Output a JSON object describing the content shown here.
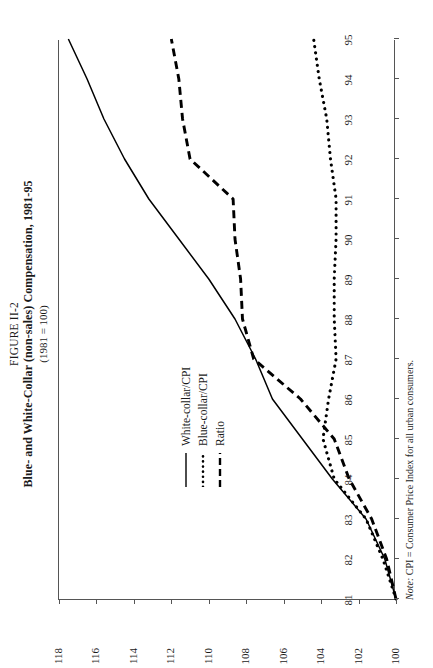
{
  "figure": {
    "number": "FIGURE II-2",
    "title": "Blue- and White-Collar (non-sales) Compensation, 1981-95",
    "subtitle": "(1981 = 100)",
    "note_label": "Note:",
    "note_text": "CPI = Consumer Price Index for all urban consumers."
  },
  "legend": {
    "position": "upper-left-inside",
    "items": [
      {
        "label": "White-collar/CPI",
        "style": "solid"
      },
      {
        "label": "Blue-collar/CPI",
        "style": "dotted"
      },
      {
        "label": "Ratio",
        "style": "dashed"
      }
    ]
  },
  "chart_data": {
    "type": "line",
    "title": "Blue- and White-Collar (non-sales) Compensation, 1981-95",
    "subtitle": "(1981 = 100)",
    "xlabel": "",
    "ylabel": "",
    "grid": false,
    "xlim": [
      1981,
      1995
    ],
    "ylim": [
      100,
      118
    ],
    "yticks": [
      100,
      102,
      104,
      106,
      108,
      110,
      112,
      114,
      116,
      118
    ],
    "ytick_labels": [
      "100",
      "102",
      "104",
      "106",
      "108",
      "110",
      "112",
      "114",
      "116",
      "118"
    ],
    "x": [
      1981,
      1982,
      1983,
      1984,
      1985,
      1986,
      1987,
      1988,
      1989,
      1990,
      1991,
      1992,
      1993,
      1994,
      1995
    ],
    "xtick_labels": [
      "81",
      "82",
      "83",
      "84",
      "85",
      "86",
      "87",
      "88",
      "89",
      "90",
      "91",
      "92",
      "93",
      "94",
      "95"
    ],
    "series": [
      {
        "name": "White-collar/CPI",
        "style": "solid",
        "color": "#000000",
        "values": [
          100.0,
          100.6,
          101.6,
          103.4,
          105.0,
          106.6,
          107.5,
          108.6,
          110.0,
          111.6,
          113.2,
          114.5,
          115.6,
          116.5,
          117.5
        ]
      },
      {
        "name": "Blue-collar/CPI",
        "style": "dotted",
        "color": "#000000",
        "values": [
          100.0,
          100.7,
          101.6,
          103.3,
          103.9,
          103.6,
          103.2,
          103.3,
          103.3,
          103.2,
          103.2,
          103.5,
          103.7,
          104.1,
          104.4
        ]
      },
      {
        "name": "Ratio",
        "style": "dashed",
        "color": "#000000",
        "values": [
          100.0,
          100.5,
          101.3,
          102.5,
          103.3,
          105.1,
          107.6,
          108.2,
          108.3,
          108.6,
          108.7,
          111.0,
          111.4,
          111.6,
          112.0
        ]
      }
    ]
  }
}
